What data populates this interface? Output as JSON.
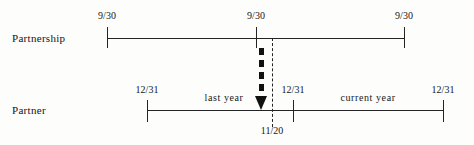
{
  "diagram": {
    "rows": [
      {
        "key": "partnership",
        "label": "Partnership"
      },
      {
        "key": "partner",
        "label": "Partner"
      }
    ],
    "partnership_axis": {
      "ticks": [
        {
          "label": "9/30",
          "x": 107
        },
        {
          "label": "9/30",
          "x": 256
        },
        {
          "label": "9/30",
          "x": 404
        }
      ]
    },
    "partner_axis": {
      "ticks": [
        {
          "label": "12/31",
          "x": 147
        },
        {
          "label": "12/31",
          "x": 293
        },
        {
          "label": "12/31",
          "x": 443
        }
      ],
      "spans": [
        {
          "label": "last year",
          "x": 224
        },
        {
          "label": "current  year",
          "x": 368
        }
      ]
    },
    "event": {
      "label": "11/20",
      "x": 272,
      "arrow": "thick-dashed-down-arrow"
    },
    "colors": {
      "ink": "#242424",
      "arrow": "#111111",
      "background": "#fdfdfc"
    }
  }
}
